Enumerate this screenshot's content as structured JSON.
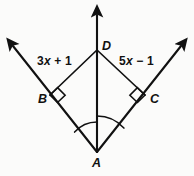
{
  "figure": {
    "background_color": "#fbfbfa",
    "stroke_color": "#111111",
    "points": {
      "A": {
        "label": "A",
        "x": 97,
        "y": 152
      },
      "B": {
        "label": "B",
        "x": 50,
        "y": 95
      },
      "C": {
        "label": "C",
        "x": 145,
        "y": 95
      },
      "D": {
        "label": "D",
        "x": 97,
        "y": 50
      }
    },
    "expressions": {
      "left_segment": {
        "full": "3x + 1",
        "coefficient": "3",
        "variable": "x",
        "operator": "+",
        "constant": "1"
      },
      "right_segment": {
        "full": "5x − 1",
        "coefficient": "5",
        "variable": "x",
        "operator": "−",
        "constant": "1"
      }
    },
    "rays": [
      {
        "name": "ray-A-to-upper-left",
        "from": "A",
        "through": "B",
        "arrow_tip": {
          "x": 8,
          "y": 42
        }
      },
      {
        "name": "ray-A-to-upper-right",
        "from": "A",
        "through": "C",
        "arrow_tip": {
          "x": 186,
          "y": 42
        }
      },
      {
        "name": "ray-A-to-up",
        "from": "A",
        "through": "D",
        "arrow_tip": {
          "x": 97,
          "y": 10
        }
      }
    ],
    "segments": [
      {
        "name": "segment-DB",
        "from": "D",
        "to": "B",
        "measure_label": "3x + 1"
      },
      {
        "name": "segment-DC",
        "from": "D",
        "to": "C",
        "measure_label": "5x − 1"
      }
    ],
    "right_angle_marks": [
      {
        "name": "right-angle-at-B",
        "vertex": "B"
      },
      {
        "name": "right-angle-at-C",
        "vertex": "C"
      }
    ],
    "angle_arcs": [
      {
        "name": "angle-arc-BAD",
        "vertex": "A",
        "radius": 30
      },
      {
        "name": "angle-arc-DAC",
        "vertex": "A",
        "radius": 36
      }
    ]
  }
}
